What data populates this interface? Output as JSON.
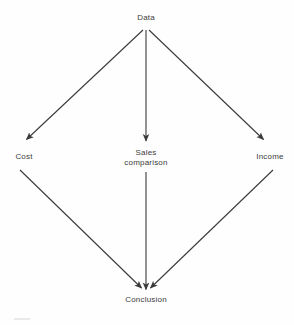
{
  "figure": {
    "type": "flow-diagram",
    "shape": "diamond",
    "background_color": "#fefefe",
    "line_color": "#3a3a3a",
    "text_color": "#3c3c3c"
  },
  "nodes": {
    "top": {
      "id": "data",
      "label": "Data"
    },
    "left": {
      "id": "cost",
      "label": "Cost"
    },
    "middle": {
      "id": "sales-comparison",
      "label_line1": "Sales",
      "label_line2": "comparison"
    },
    "right": {
      "id": "income",
      "label": "Income"
    },
    "bottom": {
      "id": "conclusion",
      "label": "Conclusion"
    }
  },
  "edges": [
    {
      "id": "data-to-cost",
      "from": "Data",
      "to": "Cost",
      "direction": "down-left",
      "arrowhead": true
    },
    {
      "id": "data-to-sales",
      "from": "Data",
      "to": "Sales comparison",
      "direction": "down",
      "arrowhead": true
    },
    {
      "id": "data-to-income",
      "from": "Data",
      "to": "Income",
      "direction": "down-right",
      "arrowhead": true
    },
    {
      "id": "cost-to-conclusion",
      "from": "Cost",
      "to": "Conclusion",
      "direction": "down-right",
      "arrowhead": true
    },
    {
      "id": "sales-to-conclusion",
      "from": "Sales comparison",
      "to": "Conclusion",
      "direction": "down",
      "arrowhead": true
    },
    {
      "id": "income-to-conclusion",
      "from": "Income",
      "to": "Conclusion",
      "direction": "down-left",
      "arrowhead": true
    }
  ]
}
